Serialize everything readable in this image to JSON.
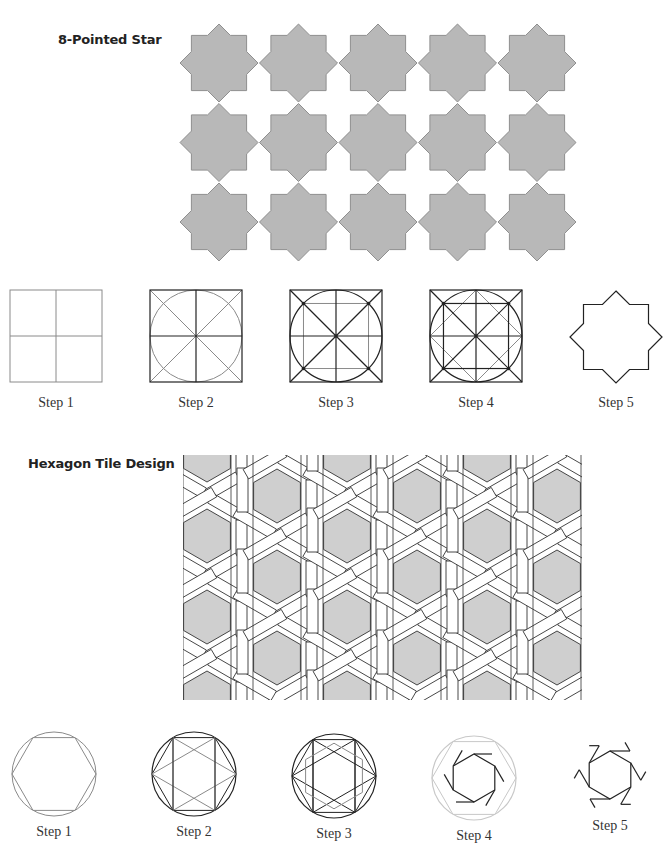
{
  "colors": {
    "tile_fill": "#b8b8b8",
    "tile_stroke": "#8f8f8f",
    "line_dark": "#222222",
    "line_mid": "#8a8a8a",
    "line_light": "#c8c8c8",
    "hex_fill": "#cfcfcf"
  },
  "star_section": {
    "title": "8-Pointed Star",
    "grid": {
      "cols": 5,
      "rows": 3,
      "x0": 219,
      "y0": 63,
      "pitch_x": 79.5,
      "pitch_y": 79.5,
      "outer_r": 39,
      "square_half": 28
    },
    "steps": [
      {
        "label": "Step 1",
        "cx": 56,
        "cy": 336
      },
      {
        "label": "Step 2",
        "cx": 196,
        "cy": 336
      },
      {
        "label": "Step 3",
        "cx": 336,
        "cy": 336
      },
      {
        "label": "Step 4",
        "cx": 476,
        "cy": 336
      },
      {
        "label": "Step 5",
        "cx": 616,
        "cy": 337
      }
    ],
    "label_y": 395
  },
  "hex_section": {
    "title": "Hexagon Tile Design",
    "region": {
      "x": 183,
      "y": 455,
      "w": 399,
      "h": 245
    },
    "hex_columns": [
      207,
      277,
      347,
      417,
      487,
      557
    ],
    "odd_col_centers_y": [
      455,
      536,
      617,
      698
    ],
    "even_col_centers_y": [
      496,
      577,
      658
    ],
    "hex_r": 27,
    "steps": [
      {
        "label": "Step 1",
        "cx": 54,
        "cy": 774,
        "label_y": 824
      },
      {
        "label": "Step 2",
        "cx": 194,
        "cy": 774,
        "label_y": 824
      },
      {
        "label": "Step 3",
        "cx": 334,
        "cy": 776,
        "label_y": 826
      },
      {
        "label": "Step 4",
        "cx": 474,
        "cy": 778,
        "label_y": 828
      },
      {
        "label": "Step 5",
        "cx": 610,
        "cy": 775,
        "label_y": 818
      }
    ]
  }
}
